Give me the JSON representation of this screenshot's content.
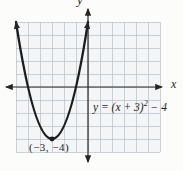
{
  "chart_data": {
    "type": "line",
    "title": "",
    "equation": "y = (x + 3)² − 4",
    "vertex": {
      "x": -3,
      "y": -4,
      "label": "(−3, −4)"
    },
    "x_intercepts": [
      -5,
      -1
    ],
    "y_intercept": 5,
    "x_range": [
      -6,
      6
    ],
    "y_range": [
      -5,
      5
    ],
    "grid": true,
    "axis_labels": {
      "x": "x",
      "y": "y"
    },
    "curve_points": [
      {
        "x": -6,
        "y": 5
      },
      {
        "x": -5,
        "y": 0
      },
      {
        "x": -4,
        "y": -3
      },
      {
        "x": -3,
        "y": -4
      },
      {
        "x": -2,
        "y": -3
      },
      {
        "x": -1,
        "y": 0
      },
      {
        "x": 0,
        "y": 5
      }
    ]
  },
  "equation_label": {
    "base": "y = (x + 3)",
    "superscript": "2",
    "tail": " − 4"
  },
  "colors": {
    "curve": "#1c1c1c",
    "axis": "#262626",
    "grid_line": "#b5bfc9",
    "grid_fill": "#f3f5f6",
    "background": "#fcfcfa",
    "text": "#1d1d1d"
  }
}
